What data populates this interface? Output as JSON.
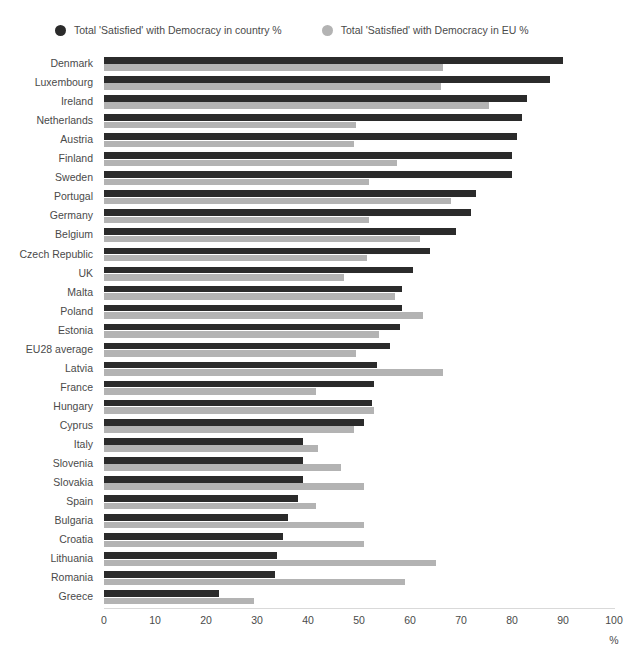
{
  "legend": {
    "entries": [
      {
        "label": "Total 'Satisfied' with Democracy in country %",
        "color": "#2b2b2b",
        "icon": "legend-dot-dark"
      },
      {
        "label": "Total 'Satisfied' with Democracy in EU %",
        "color": "#b3b3b3",
        "icon": "legend-dot-light"
      }
    ]
  },
  "axis": {
    "unit": "%",
    "ticks": [
      "0",
      "10",
      "20",
      "30",
      "40",
      "50",
      "60",
      "70",
      "80",
      "90",
      "100"
    ]
  },
  "chart_data": {
    "type": "bar",
    "orientation": "horizontal",
    "title": "",
    "xlabel": "%",
    "ylabel": "",
    "xlim": [
      0,
      100
    ],
    "grid": false,
    "legend_position": "top-left",
    "categories": [
      "Denmark",
      "Luxembourg",
      "Ireland",
      "Netherlands",
      "Austria",
      "Finland",
      "Sweden",
      "Portugal",
      "Germany",
      "Belgium",
      "Czech Republic",
      "UK",
      "Malta",
      "Poland",
      "Estonia",
      "EU28 average",
      "Latvia",
      "France",
      "Hungary",
      "Cyprus",
      "Italy",
      "Slovenia",
      "Slovakia",
      "Spain",
      "Bulgaria",
      "Croatia",
      "Lithuania",
      "Romania",
      "Greece"
    ],
    "series": [
      {
        "name": "Total 'Satisfied' with Democracy in country %",
        "color": "#2b2b2b",
        "values": [
          90,
          87.5,
          83,
          82,
          81,
          80,
          80,
          73,
          72,
          69,
          64,
          60.5,
          58.5,
          58.5,
          58,
          56,
          53.5,
          53,
          52.5,
          51,
          39,
          39,
          39,
          38,
          36,
          35,
          34,
          33.5,
          22.5
        ]
      },
      {
        "name": "Total 'Satisfied' with Democracy in EU %",
        "color": "#b3b3b3",
        "values": [
          66.5,
          66,
          75.5,
          49.5,
          49,
          57.5,
          52,
          68,
          52,
          62,
          51.5,
          47,
          57,
          62.5,
          54,
          49.5,
          66.5,
          41.5,
          53,
          49,
          42,
          46.5,
          51,
          41.5,
          51,
          51,
          65,
          59,
          29.5
        ]
      }
    ]
  }
}
